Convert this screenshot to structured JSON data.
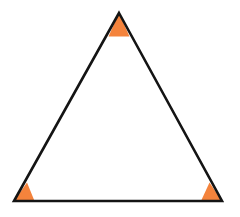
{
  "figure": {
    "kind": "geometry-diagram",
    "background_color": "#FFFFFF",
    "canvas": {
      "width": 240,
      "height": 217
    }
  },
  "style": {
    "outline_color": "#141414",
    "outline_width": 2.6,
    "angle_marker_fill": "#F4833C",
    "angle_marker_stroke": "none",
    "fill_color": "#FFFFFF"
  },
  "shape": {
    "name": "triangle",
    "vertex_count": 3,
    "vertices": [
      {
        "id": "apex",
        "label": "A",
        "x": 119,
        "y": 13
      },
      {
        "id": "bottom-right",
        "label": "C",
        "x": 222,
        "y": 201
      },
      {
        "id": "bottom-left",
        "label": "B",
        "x": 14,
        "y": 201
      }
    ],
    "edges": [
      {
        "id": "left-side",
        "from": "bottom-left",
        "to": "apex"
      },
      {
        "id": "right-side",
        "from": "apex",
        "to": "bottom-right"
      },
      {
        "id": "base",
        "from": "bottom-right",
        "to": "bottom-left"
      }
    ],
    "path": "M 119 13 L 222 201 L 14 201 Z"
  },
  "angle_markers": [
    {
      "id": "angle-marker-apex",
      "at_vertex": "apex",
      "path": "M 119 13 L 129.5 36.5 L 108.5 36.5 Z"
    },
    {
      "id": "angle-marker-bottom-left",
      "at_vertex": "bottom-left",
      "path": "M 14 201 L 34.5 201 L 27 182.5 Z"
    },
    {
      "id": "angle-marker-bottom-right",
      "at_vertex": "bottom-right",
      "path": "M 222 201 L 201 201 L 209.5 182.5 Z"
    }
  ]
}
